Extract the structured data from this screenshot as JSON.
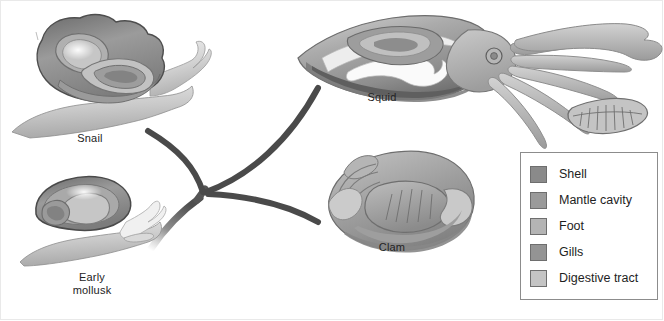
{
  "figure": {
    "background_color": "#ffffff",
    "organisms": [
      {
        "id": "snail",
        "label": "Snail",
        "label_x": 78,
        "label_y": 132
      },
      {
        "id": "squid",
        "label": "Squid",
        "label_x": 370,
        "label_y": 91
      },
      {
        "id": "clam",
        "label": "Clam",
        "label_x": 379,
        "label_y": 241
      },
      {
        "id": "early-mollusk",
        "label": "Early\nmollusk",
        "label_x": 66,
        "label_y": 272
      }
    ],
    "branch_color": "#4a4a4a",
    "trunk_note": "Branching lineage lines radiate from the early mollusk to snail, squid and clam"
  },
  "legend": {
    "border_color": "#8c8c8c",
    "items": [
      {
        "label": "Shell",
        "color": "#8a8a8a"
      },
      {
        "label": "Mantle cavity",
        "color": "#9a9a9a"
      },
      {
        "label": "Foot",
        "color": "#b4b4b4"
      },
      {
        "label": "Gills",
        "color": "#949494"
      },
      {
        "label": "Digestive tract",
        "color": "#c4c4c4"
      }
    ]
  },
  "palette": {
    "shell_dark": "#6f6f6f",
    "shell_mid": "#8f8f8f",
    "mantle": "#9c9c9c",
    "foot": "#bdbdbd",
    "gills": "#8d8d8d",
    "digestive": "#cfcfcf",
    "outline": "#5c5c5c",
    "highlight": "#f2f2f2",
    "text": "#232323"
  }
}
